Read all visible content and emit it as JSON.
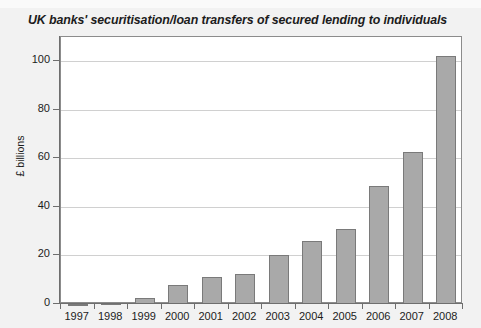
{
  "chart_data": {
    "type": "bar",
    "title": "UK banks' securitisation/loan transfers of secured lending to individuals",
    "xlabel": "",
    "ylabel": "£ billions",
    "categories": [
      "1997",
      "1998",
      "1999",
      "2000",
      "2001",
      "2002",
      "2003",
      "2004",
      "2005",
      "2006",
      "2007",
      "2008"
    ],
    "values": [
      0.2,
      0.4,
      2.3,
      8.0,
      11.0,
      12.4,
      20.0,
      25.8,
      31.0,
      48.8,
      62.8,
      102.0
    ],
    "ylim": [
      0,
      110
    ],
    "yticks": [
      0,
      20,
      40,
      60,
      80,
      100
    ],
    "ytick_labels": [
      "0",
      "20",
      "40",
      "60",
      "80",
      "100"
    ],
    "grid": "horizontal",
    "legend": "none",
    "series_name": "Securitisation/loan transfers",
    "bar_color": "#a9a9a9",
    "bar_border_color": "#7a7a7a",
    "plot_background": "#ffffff",
    "figure_background": "#f2f2f2",
    "gridline_color": "#d0d0d0",
    "axis_color": "#6e6e6e",
    "text_color": "#1c1c1c"
  }
}
